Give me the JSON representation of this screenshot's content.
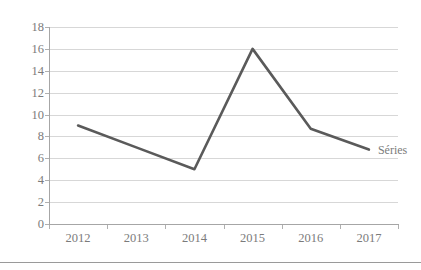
{
  "chart_data": {
    "type": "line",
    "title": "",
    "subtitle": "",
    "xlabel": "",
    "ylabel": "",
    "categories": [
      "2012",
      "2013",
      "2014",
      "2015",
      "2016",
      "2017"
    ],
    "series": [
      {
        "name": "Séries",
        "color": "#5a5a5a",
        "values": [
          9,
          7,
          5,
          16,
          8.7,
          6.8
        ]
      }
    ],
    "ylim": [
      0,
      18
    ],
    "yticks": [
      0,
      2,
      4,
      6,
      8,
      10,
      12,
      14,
      16,
      18
    ],
    "ytick_labels": [
      "0",
      "2",
      "4",
      "6",
      "8",
      "10",
      "12",
      "14",
      "16",
      "18"
    ],
    "grid": "horizontal",
    "legend_position": "right-inline",
    "legend_entries": [
      "Séries"
    ],
    "annotations": []
  },
  "legend": {
    "series_label": "Séries"
  },
  "colors": {
    "line": "#5a5a5a",
    "gridline": "#d7d7d7",
    "axis": "#a6a6a6",
    "tick_text": "#7b7b7b",
    "background": "#ffffff",
    "divider": "#9a9a9a"
  }
}
